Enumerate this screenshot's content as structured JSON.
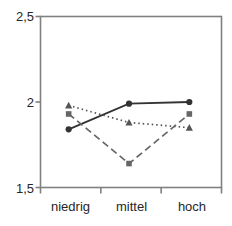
{
  "chart_data": {
    "type": "line",
    "title": "",
    "xlabel": "",
    "ylabel": "",
    "categories": [
      "niedrig",
      "mittel",
      "hoch"
    ],
    "ylim": [
      1.5,
      2.5
    ],
    "yticks": [
      1.5,
      2.0,
      2.5
    ],
    "ytick_labels": [
      "1,5",
      "2",
      "2,5"
    ],
    "grid": false,
    "legend": "none",
    "series": [
      {
        "name": "series-circle",
        "marker": "circle",
        "linestyle": "solid",
        "color": "#333333",
        "values": [
          1.84,
          1.99,
          2.0
        ]
      },
      {
        "name": "series-triangle",
        "marker": "triangle",
        "linestyle": "dotted",
        "color": "#555555",
        "values": [
          1.98,
          1.88,
          1.85
        ]
      },
      {
        "name": "series-square",
        "marker": "square",
        "linestyle": "dashed",
        "color": "#666666",
        "values": [
          1.93,
          1.64,
          1.93
        ]
      }
    ]
  },
  "axis": {
    "frame_color": "#808080",
    "tick_color": "#808080",
    "y_labels": [
      "2,5",
      "2",
      "1,5"
    ],
    "x_labels": [
      "niedrig",
      "mittel",
      "hoch"
    ]
  }
}
